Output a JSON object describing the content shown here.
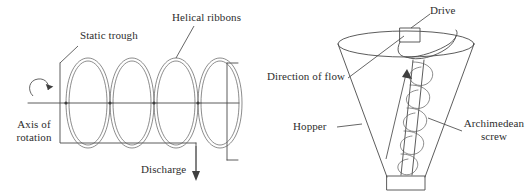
{
  "figure": {
    "background_color": "#ffffff",
    "line_color": "#4a4a4a",
    "text_color": "#2e2e2e"
  },
  "left_diagram": {
    "name": "helical-ribbon-mixer",
    "labels": {
      "static_trough": "Static trough",
      "helical_ribbons": "Helical ribbons",
      "axis_of_rotation_line1": "Axis of",
      "axis_of_rotation_line2": "rotation",
      "discharge": "Discharge"
    },
    "parts": {
      "ribbon_loops": 4,
      "rotation_arrow": "curved-rotation-arrow",
      "discharge_arrow": "down-arrow"
    }
  },
  "right_diagram": {
    "name": "archimedean-screw-hopper",
    "labels": {
      "drive": "Drive",
      "direction_of_flow": "Direction of flow",
      "hopper": "Hopper",
      "archimedean_screw_line1": "Archimedean",
      "archimedean_screw_line2": "screw"
    },
    "parts": {
      "flow_arrow": "up-arrow",
      "drive_unit": "drive-box",
      "outlet": "outlet-rectangle"
    }
  }
}
